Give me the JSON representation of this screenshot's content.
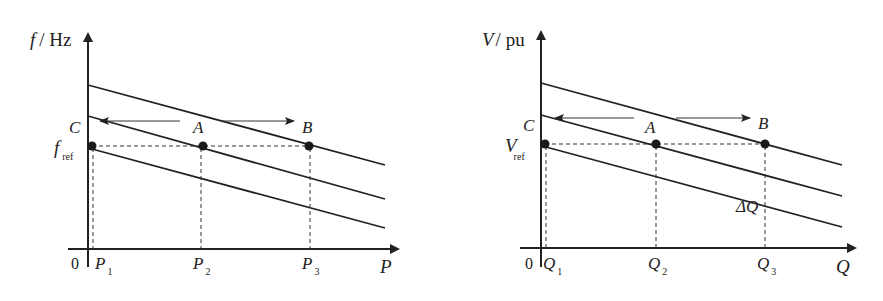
{
  "panels": [
    {
      "id": "frequency-droop",
      "y_axis_var": "f",
      "y_axis_unit": "/ Hz",
      "x_axis_var": "P",
      "origin": "0",
      "ref_var": "f",
      "ref_sub": "ref",
      "point_labels": {
        "C": "C",
        "A": "A",
        "B": "B"
      },
      "ticks": [
        {
          "var": "P",
          "sub": "1"
        },
        {
          "var": "P",
          "sub": "2"
        },
        {
          "var": "P",
          "sub": "3"
        }
      ],
      "annotation": ""
    },
    {
      "id": "voltage-droop",
      "y_axis_var": "V",
      "y_axis_unit": "/ pu",
      "x_axis_var": "Q",
      "origin": "0",
      "ref_var": "V",
      "ref_sub": "ref",
      "point_labels": {
        "C": "C",
        "A": "A",
        "B": "B"
      },
      "ticks": [
        {
          "var": "Q",
          "sub": "1"
        },
        {
          "var": "Q",
          "sub": "2"
        },
        {
          "var": "Q",
          "sub": "3"
        }
      ],
      "annotation": "ΔQ"
    }
  ]
}
